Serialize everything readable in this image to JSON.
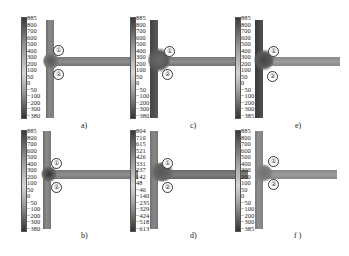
{
  "figure": {
    "panels": [
      {
        "id": "a",
        "caption": "a)",
        "markers": [
          "①",
          "②"
        ],
        "colorbar": [
          "885",
          "800",
          "700",
          "600",
          "500",
          "400",
          "300",
          "200",
          "100",
          "50",
          "0",
          "−50",
          "−100",
          "−200",
          "−300",
          "−380"
        ]
      },
      {
        "id": "c",
        "caption": "c)",
        "markers": [
          "①",
          "②"
        ],
        "colorbar": [
          "885",
          "800",
          "700",
          "600",
          "500",
          "400",
          "300",
          "200",
          "100",
          "50",
          "0",
          "−50",
          "−100",
          "−200",
          "−300",
          "−380"
        ]
      },
      {
        "id": "e",
        "caption": "e)",
        "markers": [
          "①",
          "②"
        ],
        "colorbar": [
          "885",
          "800",
          "700",
          "600",
          "500",
          "400",
          "300",
          "200",
          "100",
          "50",
          "0",
          "−50",
          "−100",
          "−200",
          "−300",
          "−385"
        ]
      },
      {
        "id": "b",
        "caption": "b)",
        "markers": [
          "①",
          "②"
        ],
        "colorbar": [
          "885",
          "800",
          "700",
          "600",
          "500",
          "400",
          "300",
          "200",
          "100",
          "50",
          "0",
          "−50",
          "−100",
          "−200",
          "−300",
          "−380"
        ]
      },
      {
        "id": "d",
        "caption": "d)",
        "markers": [
          "①",
          "②"
        ],
        "colorbar": [
          "804",
          "710",
          "615",
          "521",
          "426",
          "331",
          "237",
          "142",
          "48",
          "−46",
          "−140",
          "−235",
          "−329",
          "−424",
          "−518",
          "−613"
        ]
      },
      {
        "id": "f",
        "caption": "f )",
        "markers": [
          "①",
          "②"
        ],
        "colorbar": [
          "885",
          "800",
          "700",
          "600",
          "500",
          "400",
          "300",
          "200",
          "100",
          "50",
          "0",
          "−50",
          "−100",
          "−200",
          "−300",
          "−385"
        ]
      }
    ]
  }
}
